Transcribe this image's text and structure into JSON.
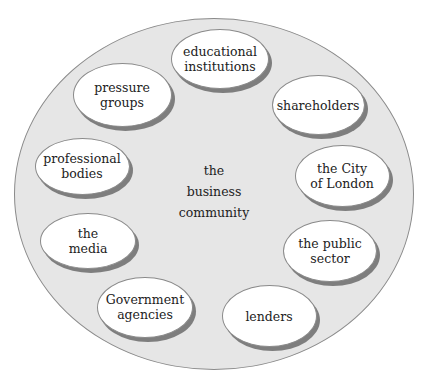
{
  "diagram": {
    "center": {
      "label": "the\nbusiness\ncommunity"
    },
    "nodes": [
      {
        "id": "educational-institutions",
        "label": "educational\ninstitutions",
        "cx": 220,
        "cy": 59,
        "w": 98,
        "h": 60
      },
      {
        "id": "shareholders",
        "label": "shareholders",
        "cx": 318,
        "cy": 105,
        "w": 93,
        "h": 60
      },
      {
        "id": "city-of-london",
        "label": "the City\nof London",
        "cx": 342,
        "cy": 176,
        "w": 95,
        "h": 62
      },
      {
        "id": "public-sector",
        "label": "the public\nsector",
        "cx": 330,
        "cy": 251,
        "w": 94,
        "h": 62
      },
      {
        "id": "lenders",
        "label": "lenders",
        "cx": 269,
        "cy": 316,
        "w": 95,
        "h": 62
      },
      {
        "id": "government-agencies",
        "label": "Government\nagencies",
        "cx": 145,
        "cy": 307,
        "w": 96,
        "h": 61
      },
      {
        "id": "the-media",
        "label": "the\nmedia",
        "cx": 88,
        "cy": 241,
        "w": 96,
        "h": 56
      },
      {
        "id": "professional-bodies",
        "label": "professional\nbodies",
        "cx": 82,
        "cy": 166,
        "w": 95,
        "h": 57
      },
      {
        "id": "pressure-groups",
        "label": "pressure\ngroups",
        "cx": 122,
        "cy": 95,
        "w": 99,
        "h": 64
      }
    ],
    "colors": {
      "outer_fill": "#e6e6e6",
      "node_fill": "#ffffff",
      "shadow": "#7e7e7e",
      "border": "#8a8a8a",
      "text": "#222222"
    }
  }
}
